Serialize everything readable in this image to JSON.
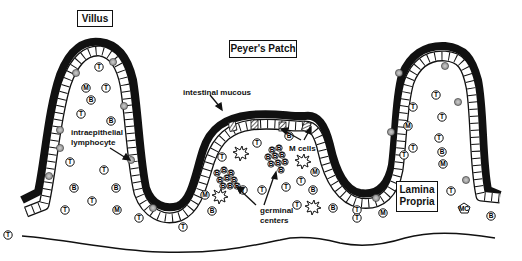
{
  "title_boxes": {
    "villus": "Villus",
    "peyers_patch": "Peyer's Patch",
    "lamina_propria_line1": "Lamina",
    "lamina_propria_line2": "Propria"
  },
  "annotations": {
    "intestinal_mucous": "intestinal mucous",
    "intraepithelial_line1": "intraepithelial",
    "intraepithelial_line2": "lymphocyte",
    "m_cells": "M cells",
    "germinal_line1": "germinal",
    "germinal_line2": "centers"
  },
  "cell_legend": {
    "T": "T",
    "B": "B",
    "M": "M",
    "MC": "MC"
  },
  "colors": {
    "ink": "#111111",
    "background": "#ffffff",
    "iel_fill": "#9a9a9a"
  },
  "cells": [
    {
      "type": "T",
      "x": 99,
      "y": 67
    },
    {
      "type": "M",
      "x": 86,
      "y": 88
    },
    {
      "type": "T",
      "x": 106,
      "y": 88
    },
    {
      "type": "B",
      "x": 91,
      "y": 100
    },
    {
      "type": "T",
      "x": 81,
      "y": 114
    },
    {
      "type": "B",
      "x": 111,
      "y": 121
    },
    {
      "type": "T",
      "x": 70,
      "y": 162
    },
    {
      "type": "T",
      "x": 104,
      "y": 170
    },
    {
      "type": "B",
      "x": 74,
      "y": 188
    },
    {
      "type": "B",
      "x": 116,
      "y": 188
    },
    {
      "type": "T",
      "x": 92,
      "y": 201
    },
    {
      "type": "T",
      "x": 65,
      "y": 210
    },
    {
      "type": "M",
      "x": 117,
      "y": 210
    },
    {
      "type": "T",
      "x": 139,
      "y": 218
    },
    {
      "type": "T",
      "x": 8,
      "y": 235
    },
    {
      "type": "T",
      "x": 183,
      "y": 227
    },
    {
      "type": "B",
      "x": 289,
      "y": 136
    },
    {
      "type": "T",
      "x": 257,
      "y": 143
    },
    {
      "type": "T",
      "x": 222,
      "y": 157
    },
    {
      "type": "M",
      "x": 315,
      "y": 172
    },
    {
      "type": "T",
      "x": 301,
      "y": 181
    },
    {
      "type": "T",
      "x": 262,
      "y": 190
    },
    {
      "type": "T",
      "x": 286,
      "y": 187
    },
    {
      "type": "B",
      "x": 313,
      "y": 190
    },
    {
      "type": "M",
      "x": 205,
      "y": 195
    },
    {
      "type": "T",
      "x": 243,
      "y": 190
    },
    {
      "type": "B",
      "x": 212,
      "y": 211
    },
    {
      "type": "T",
      "x": 297,
      "y": 205
    },
    {
      "type": "B",
      "x": 333,
      "y": 208
    },
    {
      "type": "T",
      "x": 357,
      "y": 210
    },
    {
      "type": "M",
      "x": 383,
      "y": 213
    },
    {
      "type": "T",
      "x": 436,
      "y": 95
    },
    {
      "type": "T",
      "x": 413,
      "y": 107
    },
    {
      "type": "T",
      "x": 442,
      "y": 117
    },
    {
      "type": "M",
      "x": 408,
      "y": 126
    },
    {
      "type": "T",
      "x": 439,
      "y": 138
    },
    {
      "type": "T",
      "x": 413,
      "y": 148
    },
    {
      "type": "B",
      "x": 442,
      "y": 152
    },
    {
      "type": "T",
      "x": 404,
      "y": 155
    },
    {
      "type": "M",
      "x": 443,
      "y": 164
    },
    {
      "type": "T",
      "x": 451,
      "y": 191
    },
    {
      "type": "T",
      "x": 357,
      "y": 218
    },
    {
      "type": "B",
      "x": 491,
      "y": 216
    }
  ]
}
